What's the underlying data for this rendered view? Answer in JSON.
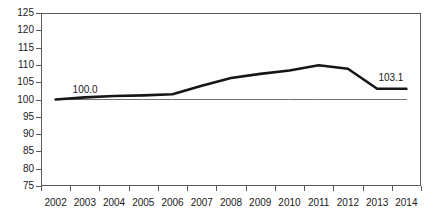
{
  "chart_data": {
    "type": "line",
    "title": "",
    "subtitle": "",
    "xlabel": "",
    "ylabel": "",
    "categories": [
      "2002",
      "2003",
      "2004",
      "2005",
      "2006",
      "2007",
      "2008",
      "2009",
      "2010",
      "2011",
      "2012",
      "2013",
      "2014"
    ],
    "series": [
      {
        "name": "Index",
        "values": [
          100.0,
          100.6,
          101.0,
          101.2,
          101.5,
          104.0,
          106.2,
          107.4,
          108.4,
          109.9,
          108.9,
          103.1,
          103.1
        ],
        "color": "#161616",
        "line_width": 2.6
      },
      {
        "name": "Baseline 100",
        "values": [
          100.0,
          100.0,
          100.0,
          100.0,
          100.0,
          100.0,
          100.0,
          100.0,
          100.0,
          100.0,
          100.0,
          100.0,
          100.0
        ],
        "color": "#6f6f6f",
        "line_width": 1
      }
    ],
    "ylim": [
      75,
      125
    ],
    "ytick_step": 5,
    "yticks": [
      125,
      120,
      115,
      110,
      105,
      100,
      95,
      90,
      85,
      80,
      75
    ],
    "ytick_labels": [
      "125",
      "120",
      "115",
      "110",
      "105",
      "100",
      "95",
      "90",
      "85",
      "80",
      "75"
    ],
    "xtick_labels": [
      "2002",
      "2003",
      "2004",
      "2005",
      "2006",
      "2007",
      "2008",
      "2009",
      "2010",
      "2011",
      "2012",
      "2013",
      "2014"
    ],
    "grid": false,
    "legend": "none",
    "annotations": [
      {
        "name": "start-value-label",
        "text": "100.0",
        "category": "2002",
        "value": 100.0
      },
      {
        "name": "end-value-label",
        "text": "103.1",
        "category": "2014",
        "value": 103.1
      }
    ]
  },
  "axis": {
    "y_labels": [
      "125",
      "120",
      "115",
      "110",
      "105",
      "100",
      "95",
      "90",
      "85",
      "80",
      "75"
    ],
    "x_labels": [
      "2002",
      "2003",
      "2004",
      "2005",
      "2006",
      "2007",
      "2008",
      "2009",
      "2010",
      "2011",
      "2012",
      "2013",
      "2014"
    ]
  },
  "labels": {
    "start": "100.0",
    "end": "103.1"
  }
}
